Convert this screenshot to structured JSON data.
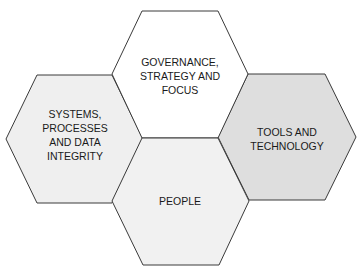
{
  "diagram": {
    "type": "hexagon-cluster",
    "hexagons": [
      {
        "id": "governance",
        "lines": [
          "GOVERNANCE,",
          "STRATEGY AND",
          "FOCUS"
        ],
        "fill": "#ffffff",
        "position": "top"
      },
      {
        "id": "systems",
        "lines": [
          "SYSTEMS,",
          "PROCESSES",
          "AND DATA",
          "INTEGRITY"
        ],
        "fill": "#efefef",
        "position": "left"
      },
      {
        "id": "tools",
        "lines": [
          "TOOLS AND",
          "TECHNOLOGY"
        ],
        "fill": "#dedede",
        "position": "right"
      },
      {
        "id": "people",
        "lines": [
          "PEOPLE"
        ],
        "fill": "#f1f1f1",
        "position": "bottom"
      }
    ],
    "stroke_color": "#3a3a3a"
  }
}
